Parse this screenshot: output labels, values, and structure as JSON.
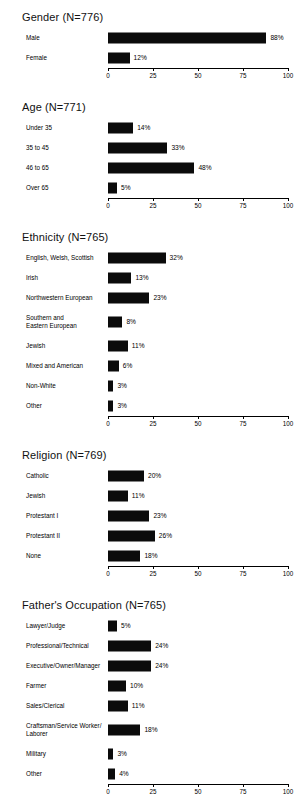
{
  "figure": {
    "background": "#ffffff",
    "bar_color": "#0b0b0b",
    "axis_color": "#000000"
  },
  "axis": {
    "ticks": [
      "0",
      "25",
      "50",
      "75",
      "100"
    ],
    "min": 0,
    "max": 100
  },
  "chart_data": [
    {
      "type": "bar",
      "title": "Gender (N=776)",
      "orientation": "horizontal",
      "categories": [
        "Male",
        "Female"
      ],
      "values": [
        88,
        12
      ],
      "value_labels": [
        "88%",
        "12%"
      ],
      "xlabel": "",
      "ylabel": "",
      "xlim": [
        0,
        100
      ],
      "xticks": [
        0,
        25,
        50,
        75,
        100
      ],
      "grid": false,
      "legend": "none"
    },
    {
      "type": "bar",
      "title": "Age (N=771)",
      "orientation": "horizontal",
      "categories": [
        "Under 35",
        "35 to 45",
        "46 to 65",
        "Over 65"
      ],
      "values": [
        14,
        33,
        48,
        5
      ],
      "value_labels": [
        "14%",
        "33%",
        "48%",
        "5%"
      ],
      "xlabel": "",
      "ylabel": "",
      "xlim": [
        0,
        100
      ],
      "xticks": [
        0,
        25,
        50,
        75,
        100
      ],
      "grid": false,
      "legend": "none"
    },
    {
      "type": "bar",
      "title": "Ethnicity (N=765)",
      "orientation": "horizontal",
      "categories": [
        "English, Welsh, Scottish",
        "Irish",
        "Northwestern European",
        "Southern and\nEastern European",
        "Jewish",
        "Mixed and American",
        "Non-White",
        "Other"
      ],
      "values": [
        32,
        13,
        23,
        8,
        11,
        6,
        3,
        3
      ],
      "value_labels": [
        "32%",
        "13%",
        "23%",
        "8%",
        "11%",
        "6%",
        "3%",
        "3%"
      ],
      "xlabel": "",
      "ylabel": "",
      "xlim": [
        0,
        100
      ],
      "xticks": [
        0,
        25,
        50,
        75,
        100
      ],
      "grid": false,
      "legend": "none"
    },
    {
      "type": "bar",
      "title": "Religion (N=769)",
      "orientation": "horizontal",
      "categories": [
        "Catholic",
        "Jewish",
        "Protestant I",
        "Protestant II",
        "None"
      ],
      "values": [
        20,
        11,
        23,
        26,
        18
      ],
      "value_labels": [
        "20%",
        "11%",
        "23%",
        "26%",
        "18%"
      ],
      "xlabel": "",
      "ylabel": "",
      "xlim": [
        0,
        100
      ],
      "xticks": [
        0,
        25,
        50,
        75,
        100
      ],
      "grid": false,
      "legend": "none"
    },
    {
      "type": "bar",
      "title": "Father's Occupation (N=765)",
      "orientation": "horizontal",
      "categories": [
        "Lawyer/Judge",
        "Professional/Technical",
        "Executive/Owner/Manager",
        "Farmer",
        "Sales/Clerical",
        "Craftsman/Service Worker/\nLaborer",
        "Military",
        "Other"
      ],
      "values": [
        5,
        24,
        24,
        10,
        11,
        18,
        3,
        4
      ],
      "value_labels": [
        "5%",
        "24%",
        "24%",
        "10%",
        "11%",
        "18%",
        "3%",
        "4%"
      ],
      "xlabel": "",
      "ylabel": "",
      "xlim": [
        0,
        100
      ],
      "xticks": [
        0,
        25,
        50,
        75,
        100
      ],
      "grid": false,
      "legend": "none"
    }
  ]
}
